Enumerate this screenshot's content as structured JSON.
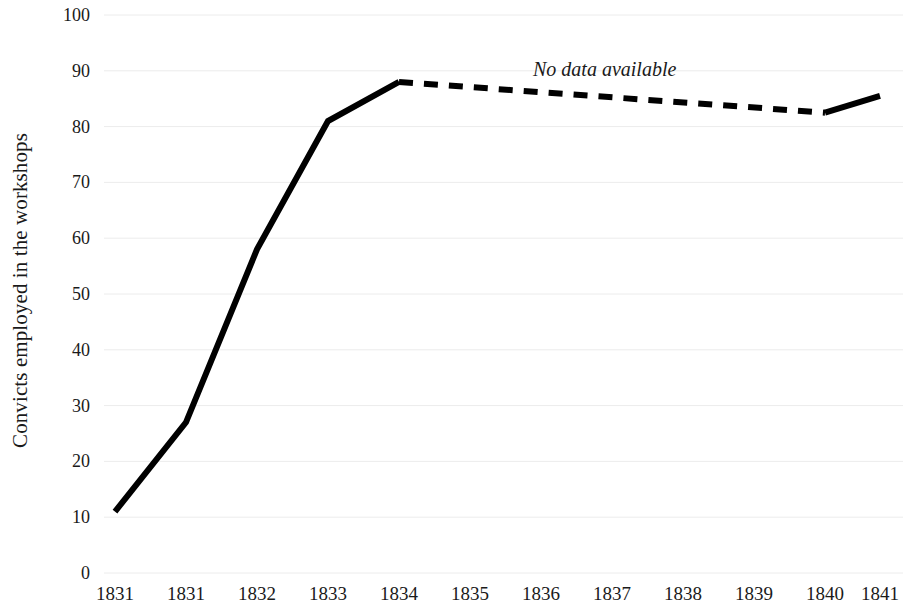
{
  "chart_data": {
    "type": "line",
    "title": "",
    "xlabel": "",
    "ylabel": "Convicts employed in the workshops",
    "ylim": [
      0,
      100
    ],
    "ytick_values": [
      0,
      10,
      20,
      30,
      40,
      50,
      60,
      70,
      80,
      90,
      100
    ],
    "ytick_labels": [
      "0",
      "10",
      "20",
      "30",
      "40",
      "50",
      "60",
      "70",
      "80",
      "90",
      "100"
    ],
    "categories": [
      "1831",
      "1831",
      "1832",
      "1833",
      "1834",
      "1835",
      "1836",
      "1837",
      "1838",
      "1839",
      "1840",
      "1841"
    ],
    "grid": true,
    "grid_axis": "y",
    "legend": false,
    "series": [
      {
        "name": "Convicts employed in the workshops",
        "style": "solid",
        "color": "#000000",
        "points": [
          {
            "category": "1831",
            "index": 0,
            "value": 11
          },
          {
            "category": "1831",
            "index": 1,
            "value": 27
          },
          {
            "category": "1832",
            "index": 2,
            "value": 58
          },
          {
            "category": "1833",
            "index": 3,
            "value": 81
          },
          {
            "category": "1834",
            "index": 4,
            "value": 88
          }
        ]
      },
      {
        "name": "No data available (interpolated)",
        "style": "dashed",
        "color": "#000000",
        "points": [
          {
            "category": "1834",
            "index": 4,
            "value": 88
          },
          {
            "category": "1840",
            "index": 10,
            "value": 82.5
          }
        ]
      },
      {
        "name": "Convicts employed in the workshops",
        "style": "solid",
        "color": "#000000",
        "points": [
          {
            "category": "1840",
            "index": 10,
            "value": 82.5
          },
          {
            "category": "1841",
            "index": 11,
            "value": 85.5
          }
        ]
      }
    ],
    "annotations": [
      {
        "id": "annotation-workshops-former-store",
        "text": "Workshops takes over former store",
        "orientation": "vertical",
        "at_category": "1832"
      },
      {
        "id": "annotation-new-workshops",
        "text": "New workshops approved and commenced",
        "orientation": "vertical",
        "at_category": "1834"
      },
      {
        "id": "annotation-no-data",
        "text": "No data available",
        "orientation": "horizontal-italic",
        "at_category": "1836"
      }
    ]
  },
  "colors": {
    "line": "#000000",
    "grid": "#ececec",
    "text": "#1a1a1a",
    "background": "#ffffff"
  }
}
